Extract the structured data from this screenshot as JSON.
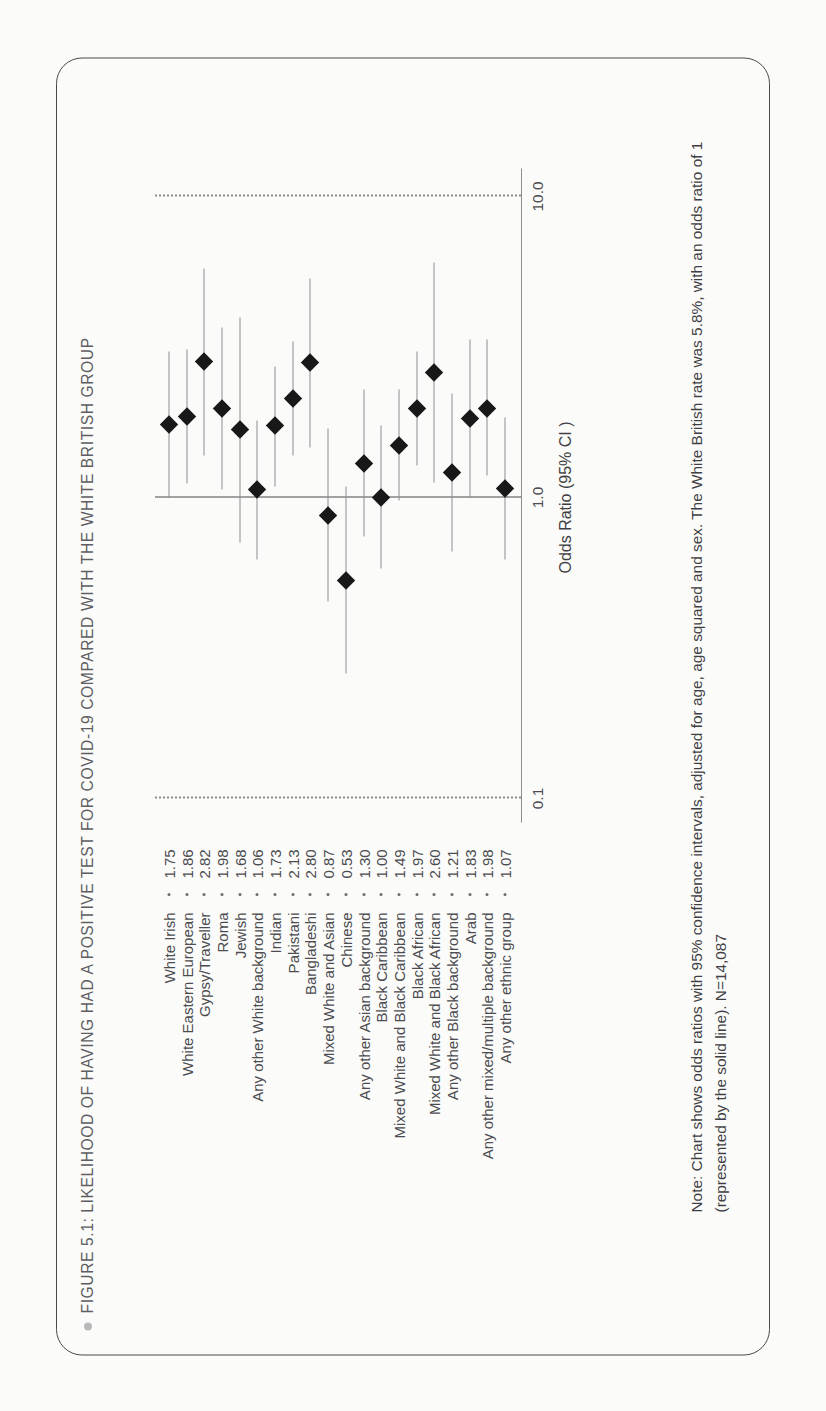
{
  "figure": {
    "bullet_icon": "bullet-dot",
    "title": "FIGURE 5.1: LIKELIHOOD OF HAVING HAD A POSITIVE TEST FOR COVID-19 COMPARED WITH THE WHITE BRITISH GROUP",
    "note": "Note: Chart shows odds ratios with 95% confidence intervals, adjusted for age, age squared and sex. The White British rate was 5.8%, with an odds ratio of 1 (represented by the solid line). N=14,087"
  },
  "colors": {
    "border": "#4a4a4a",
    "title_text": "#5e5e62",
    "marker": "#181818",
    "whisker": "#8e8e91",
    "grid_dotted": "#8d8d90",
    "reference_line": "#4a4a4a",
    "bullet": "#b9b9bb"
  },
  "chart_data": {
    "type": "scatter",
    "title": "FIGURE 5.1: LIKELIHOOD OF HAVING HAD A POSITIVE TEST FOR COVID-19 COMPARED WITH THE WHITE BRITISH GROUP",
    "xlabel": "",
    "ylabel": "Odds Ratio (95% CI )",
    "axis_title": "Odds Ratio (95% CI )",
    "scale": "log",
    "ylim": [
      0.1,
      10.0
    ],
    "tick_labels": [
      "0.1",
      "1.0",
      "10.0"
    ],
    "tick_values": [
      0.1,
      1.0,
      10.0
    ],
    "reference_value": 1.0,
    "grid": "dotted at 0.1 and 10.0, solid reference at 1.0",
    "legend": "none",
    "categories": [
      "White Irish",
      "White Eastern European",
      "Gypsy/Traveller",
      "Roma",
      "Jewish",
      "Any other White background",
      "Indian",
      "Pakistani",
      "Bangladeshi",
      "Mixed White and Asian",
      "Chinese",
      "Any other Asian background",
      "Black Caribbean",
      "Mixed White and Black Caribbean",
      "Black African",
      "Mixed White and Black African",
      "Any other Black background",
      "Arab",
      "Any other mixed/multiple background",
      "Any other ethnic group"
    ],
    "values": [
      1.75,
      1.86,
      2.82,
      1.98,
      1.68,
      1.06,
      1.73,
      2.13,
      2.8,
      0.87,
      0.53,
      1.3,
      1.0,
      1.49,
      1.97,
      2.6,
      1.21,
      1.83,
      1.98,
      1.07
    ],
    "value_labels": [
      "1.75",
      "1.86",
      "2.82",
      "1.98",
      "1.68",
      "1.06",
      "1.73",
      "2.13",
      "2.80",
      "0.87",
      "0.53",
      "1.30",
      "1.00",
      "1.49",
      "1.97",
      "2.60",
      "1.21",
      "1.83",
      "1.98",
      "1.07"
    ],
    "ci_low": [
      1.0,
      1.11,
      1.38,
      1.06,
      0.71,
      0.62,
      1.09,
      1.38,
      1.47,
      0.45,
      0.26,
      0.74,
      0.58,
      0.98,
      1.28,
      1.12,
      0.66,
      1.0,
      1.18,
      0.62
    ],
    "ci_high": [
      3.05,
      3.1,
      5.78,
      3.68,
      3.96,
      1.8,
      2.73,
      3.3,
      5.35,
      1.69,
      1.09,
      2.28,
      1.73,
      2.28,
      3.05,
      6.05,
      2.22,
      3.36,
      3.34,
      1.85
    ]
  }
}
